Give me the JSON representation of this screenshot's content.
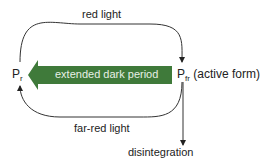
{
  "diagram": {
    "nodes": {
      "pr": {
        "main": "P",
        "sub": "r",
        "suffix": ""
      },
      "pfr": {
        "main": "P",
        "sub": "fr",
        "suffix": " (active form)"
      },
      "disintegration": "disintegration"
    },
    "edges": {
      "top": "red light",
      "bottom": "far-red light",
      "middle": "extended dark period"
    },
    "colors": {
      "arrow_green": "#3f7a3a",
      "line": "#333333"
    }
  }
}
